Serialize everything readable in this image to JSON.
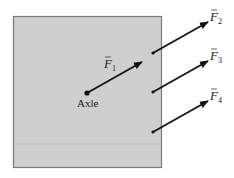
{
  "diagram": {
    "plate": {
      "x": 13,
      "y": 16,
      "width": 149,
      "height": 152,
      "fill": "#cfcfcf",
      "stroke": "#7a7a7a",
      "seam_y": 144
    },
    "axle": {
      "label": "Axle",
      "x": 87,
      "y": 93
    },
    "forces": [
      {
        "id": "F1",
        "letter": "F",
        "subscript": "1",
        "x1": 87,
        "y1": 93,
        "x2": 142,
        "y2": 62,
        "label_x": 104,
        "label_y": 68
      },
      {
        "id": "F2",
        "letter": "F",
        "subscript": "2",
        "x1": 153,
        "y1": 53,
        "x2": 208,
        "y2": 22,
        "label_x": 210,
        "label_y": 22
      },
      {
        "id": "F3",
        "letter": "F",
        "subscript": "3",
        "x1": 153,
        "y1": 92,
        "x2": 208,
        "y2": 61,
        "label_x": 210,
        "label_y": 61
      },
      {
        "id": "F4",
        "letter": "F",
        "subscript": "4",
        "x1": 153,
        "y1": 132,
        "x2": 208,
        "y2": 101,
        "label_x": 210,
        "label_y": 101
      }
    ],
    "colors": {
      "arrow": "#111111",
      "background": "#ffffff"
    }
  }
}
